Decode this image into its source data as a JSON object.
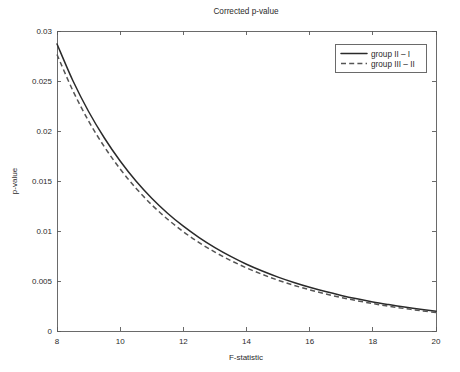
{
  "chart_data": {
    "type": "line",
    "title": "Corrected p-value",
    "xlabel": "F-statistic",
    "ylabel": "p-value",
    "xlim": [
      8,
      20
    ],
    "ylim": [
      0,
      0.03
    ],
    "grid": false,
    "legend_position": "top-right",
    "xticks": [
      8,
      10,
      12,
      14,
      16,
      18,
      20
    ],
    "xtick_labels": [
      "8",
      "10",
      "12",
      "14",
      "16",
      "18",
      "20"
    ],
    "yticks": [
      0,
      0.005,
      0.01,
      0.015,
      0.02,
      0.025,
      0.03
    ],
    "ytick_labels": [
      "0",
      "0.005",
      "0.01",
      "0.015",
      "0.02",
      "0.025",
      "0.03"
    ],
    "x": [
      8,
      8.5,
      9,
      9.5,
      10,
      10.5,
      11,
      11.5,
      12,
      12.5,
      13,
      13.5,
      14,
      14.5,
      15,
      15.5,
      16,
      16.5,
      17,
      17.5,
      18,
      18.5,
      19,
      19.5,
      20
    ],
    "series": [
      {
        "name": "group II – I",
        "style": "solid",
        "color": "#2a2a2a",
        "values": [
          0.0287,
          0.02505,
          0.02195,
          0.0193,
          0.017,
          0.015,
          0.01328,
          0.01178,
          0.01048,
          0.00934,
          0.00834,
          0.00746,
          0.00668,
          0.006,
          0.00539,
          0.00485,
          0.00437,
          0.00394,
          0.00356,
          0.00322,
          0.00291,
          0.00264,
          0.00239,
          0.00217,
          0.00197
        ]
      },
      {
        "name": "group III – II",
        "style": "dashed",
        "color": "#555555",
        "values": [
          0.02765,
          0.02405,
          0.021,
          0.01842,
          0.0162,
          0.01428,
          0.01262,
          0.01118,
          0.00993,
          0.00884,
          0.00789,
          0.00705,
          0.00631,
          0.00566,
          0.00508,
          0.00457,
          0.00412,
          0.00371,
          0.00335,
          0.00303,
          0.00274,
          0.00248,
          0.00225,
          0.00204,
          0.00185
        ]
      }
    ],
    "annotations": []
  },
  "legend": {
    "entries": [
      {
        "label": "group II – I"
      },
      {
        "label": "group III – II"
      }
    ]
  }
}
